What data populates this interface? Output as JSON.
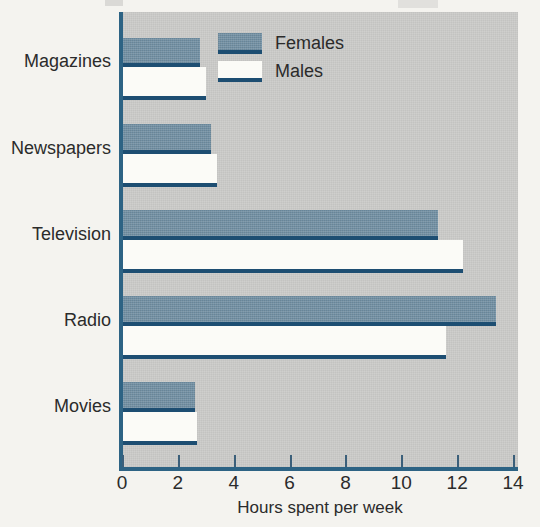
{
  "chart_data": {
    "type": "bar",
    "orientation": "horizontal",
    "title": "",
    "xlabel": "Hours spent per week",
    "ylabel": "",
    "categories": [
      "Magazines",
      "Newspapers",
      "Television",
      "Radio",
      "Movies"
    ],
    "series": [
      {
        "name": "Females",
        "color": "#718fa3",
        "values": [
          2.8,
          3.2,
          11.3,
          13.4,
          2.6
        ]
      },
      {
        "name": "Males",
        "color": "#fbfbf7",
        "values": [
          3.0,
          3.4,
          12.2,
          11.6,
          2.7
        ]
      }
    ],
    "xlim": [
      0,
      14
    ],
    "xticks": [
      0,
      2,
      4,
      6,
      8,
      10,
      12,
      14
    ],
    "xtick_labels": [
      "0",
      "2",
      "4",
      "6",
      "8",
      "10",
      "12",
      "14"
    ],
    "grid": false,
    "legend_position": "top-right",
    "plot_background": "#c3c3c1",
    "axis_color": "#2d6384"
  },
  "axis": {
    "title": "Hours spent per week",
    "ticks": [
      "0",
      "2",
      "4",
      "6",
      "8",
      "10",
      "12",
      "14"
    ]
  },
  "categories": [
    {
      "label": "Magazines"
    },
    {
      "label": "Newspapers"
    },
    {
      "label": "Television"
    },
    {
      "label": "Radio"
    },
    {
      "label": "Movies"
    }
  ],
  "legend": {
    "items": [
      {
        "label": "Females",
        "swatch": "female"
      },
      {
        "label": "Males",
        "swatch": "male"
      }
    ]
  }
}
